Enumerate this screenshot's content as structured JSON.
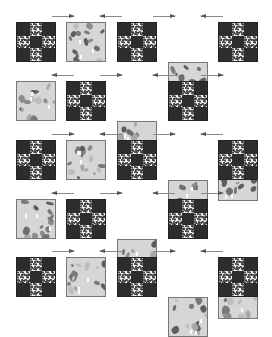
{
  "figure": {
    "caption": "",
    "layout": {
      "rows": 5,
      "columns": 5
    },
    "block_types": {
      "nine_patch": "Nine-patch block: dark corners and center, white speckled side squares",
      "print": "Alternate block: light grey scrappy print fabric"
    },
    "colors": {
      "dark_fabric": "#2d2d2d",
      "light_fabric": "#f2f2f2",
      "print_base": "#d6d6d6",
      "print_motif": "#6e6e6e",
      "arrow": "#8a8a8a"
    },
    "rows": [
      {
        "blocks": [
          "nine_patch",
          "print",
          "nine_patch",
          "print",
          "nine_patch"
        ],
        "arrows": [
          "right",
          "left",
          "right",
          "left"
        ]
      },
      {
        "blocks": [
          "print",
          "nine_patch",
          "print",
          "nine_patch",
          "print"
        ],
        "arrows": [
          "left",
          "right",
          "left",
          "right"
        ]
      },
      {
        "blocks": [
          "nine_patch",
          "print",
          "nine_patch",
          "print",
          "nine_patch"
        ],
        "arrows": [
          "right",
          "left",
          "right",
          "left"
        ]
      },
      {
        "blocks": [
          "print",
          "nine_patch",
          "print",
          "nine_patch",
          "print"
        ],
        "arrows": [
          "left",
          "right",
          "left",
          "right"
        ]
      },
      {
        "blocks": [
          "nine_patch",
          "print",
          "nine_patch",
          "print",
          "nine_patch"
        ],
        "arrows": [
          "right",
          "left",
          "right",
          "left"
        ]
      }
    ]
  }
}
